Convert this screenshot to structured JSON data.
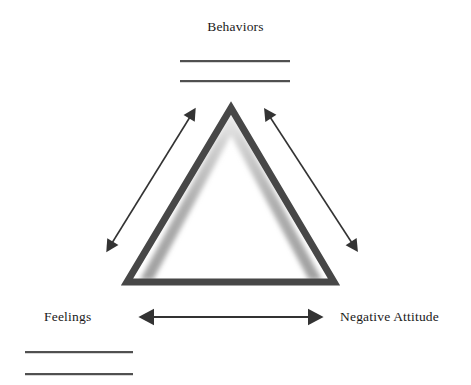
{
  "diagram": {
    "title_label": "Behaviors",
    "left_label": "Feelings",
    "right_label": "Negative Attitude",
    "shape": "triangle",
    "colors": {
      "triangle_stroke": "#474747",
      "triangle_glow": "#b9b9b9",
      "arrow": "#333333",
      "line": "#3c3c3c",
      "text": "#1a1a1a",
      "background": "#ffffff"
    },
    "geometry": {
      "apex": [
        231,
        108
      ],
      "base_left": [
        127,
        282
      ],
      "base_right": [
        334,
        282
      ],
      "stroke_width": 7
    },
    "arrows": [
      {
        "name": "feelings-behaviors-arrow",
        "from": [
          112,
          243
        ],
        "to": [
          190,
          117
        ],
        "double_headed": true
      },
      {
        "name": "behaviors-attitude-arrow",
        "from": [
          270,
          117
        ],
        "to": [
          352,
          243
        ],
        "double_headed": true
      },
      {
        "name": "feelings-attitude-arrow",
        "from": [
          152,
          317
        ],
        "to": [
          310,
          317
        ],
        "double_headed": true
      }
    ],
    "write_lines": [
      {
        "name": "behaviors-line-1",
        "group": "behaviors"
      },
      {
        "name": "behaviors-line-2",
        "group": "behaviors"
      },
      {
        "name": "feelings-line-1",
        "group": "feelings"
      },
      {
        "name": "feelings-line-2",
        "group": "feelings"
      }
    ]
  }
}
